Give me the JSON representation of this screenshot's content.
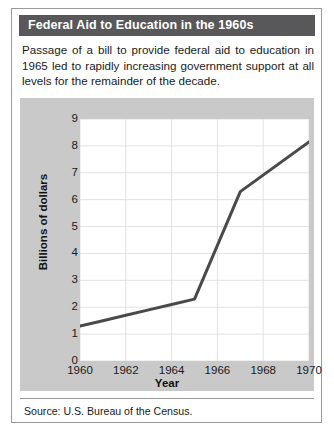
{
  "card": {
    "title": "Federal Aid to Education in the 1960s",
    "title_bar_color": "#58585a",
    "title_text_color": "#ffffff",
    "intro": "Passage of a bill to provide federal aid to education in 1965 led to rapidly increasing government support at all levels for the remainder of the decade.",
    "source": "Source: U.S. Bureau of the Census.",
    "band_color": "#c9c9c9",
    "border_color": "#9a9a9a"
  },
  "chart_data": {
    "type": "line",
    "title": "Federal Aid to Education in the 1960s",
    "xlabel": "Year",
    "ylabel": "Billions of dollars",
    "xlim": [
      1960,
      1970
    ],
    "ylim": [
      0,
      9
    ],
    "xticks": [
      1960,
      1962,
      1964,
      1966,
      1968,
      1970
    ],
    "ytick_labels": [
      "0",
      "1",
      "2",
      "3",
      "4",
      "5",
      "6",
      "7",
      "8",
      "9"
    ],
    "yticks": [
      0,
      1,
      2,
      3,
      4,
      5,
      6,
      7,
      8,
      9
    ],
    "grid": true,
    "grid_color": "#e2e2e2",
    "legend": "none",
    "line_color": "#4a4a4a",
    "line_width": 3,
    "x": [
      1960,
      1961,
      1962,
      1963,
      1964,
      1965,
      1967,
      1970
    ],
    "values": [
      1.3,
      1.5,
      1.7,
      1.9,
      2.1,
      2.3,
      6.3,
      8.15
    ],
    "series": [
      {
        "name": "Federal aid to education",
        "points": [
          {
            "x": 1960,
            "y": 1.3
          },
          {
            "x": 1961,
            "y": 1.5
          },
          {
            "x": 1962,
            "y": 1.7
          },
          {
            "x": 1963,
            "y": 1.9
          },
          {
            "x": 1964,
            "y": 2.1
          },
          {
            "x": 1965,
            "y": 2.3
          },
          {
            "x": 1967,
            "y": 6.3
          },
          {
            "x": 1970,
            "y": 8.15
          }
        ]
      }
    ]
  }
}
